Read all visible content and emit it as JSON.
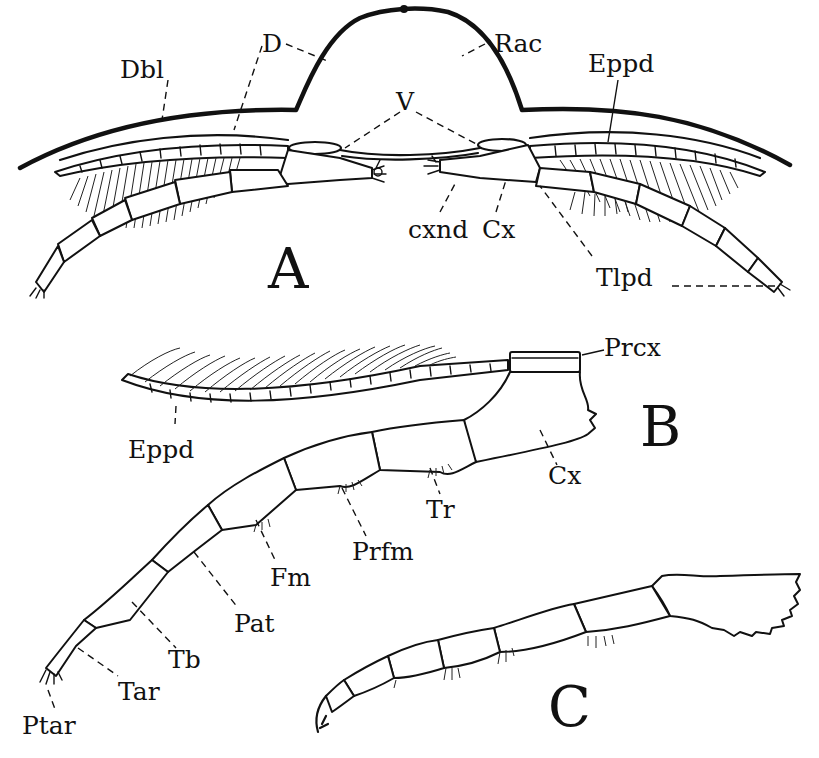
{
  "figure": {
    "panels": [
      {
        "id": "A",
        "label": "A",
        "description": "Transverse section through trilobite showing dorsal exoskeleton, doublure, ventral membrane and paired biramous appendages",
        "labels": {
          "dbl": "Dbl",
          "d": "D",
          "rac": "Rac",
          "eppd": "Eppd",
          "v": "V",
          "cxnd": "cxnd",
          "cx": "Cx",
          "tlpd": "Tlpd"
        }
      },
      {
        "id": "B",
        "label": "B",
        "description": "Single biramous appendage with exopodite and segmented telopodite",
        "labels": {
          "prcx": "Prcx",
          "eppd": "Eppd",
          "cx": "Cx",
          "tr": "Tr",
          "prfm": "Prfm",
          "fm": "Fm",
          "pat": "Pat",
          "tb": "Tb",
          "tar": "Tar",
          "ptar": "Ptar"
        }
      },
      {
        "id": "C",
        "label": "C",
        "description": "Walking leg with spiny coxal endite"
      }
    ],
    "colors": {
      "ink": "#111111",
      "paper": "#ffffff"
    }
  }
}
